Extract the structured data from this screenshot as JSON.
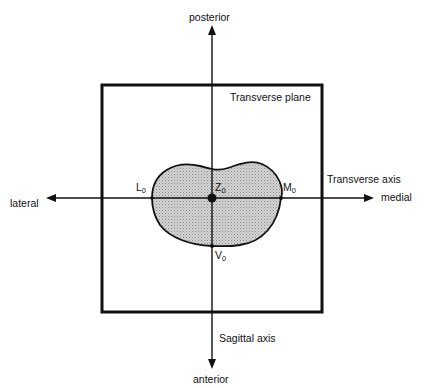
{
  "diagram": {
    "title": "Transverse plane",
    "directions": {
      "top": "posterior",
      "bottom": "anterior",
      "left": "lateral",
      "right": "medial"
    },
    "axes": {
      "horizontal": "Transverse axis",
      "vertical": "Sagittal axis"
    },
    "points": {
      "L": {
        "main": "L",
        "sub": "0"
      },
      "Z": {
        "main": "Z",
        "sub": "0"
      },
      "M": {
        "main": "M",
        "sub": "0"
      },
      "V": {
        "main": "V",
        "sub": "0"
      }
    },
    "colors": {
      "line": "#111111",
      "fill": "#c8c8c8"
    }
  }
}
